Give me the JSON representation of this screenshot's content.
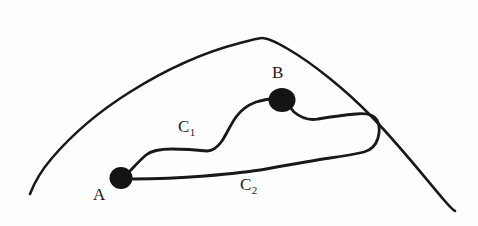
{
  "figure": {
    "background_color": "#fefefe",
    "stroke_color": "#191919",
    "node_color": "#141414",
    "width": 478,
    "height": 226,
    "labels": {
      "point_a": "A",
      "point_b": "B",
      "curve_c1_base": "C",
      "curve_c1_sub": "1",
      "curve_c2_base": "C",
      "curve_c2_sub": "2"
    },
    "nodes": [
      {
        "name": "A",
        "x": 121,
        "y": 178,
        "rx": 11.5,
        "ry": 11.0
      },
      {
        "name": "B",
        "x": 282,
        "y": 100,
        "rx": 13.5,
        "ry": 12.0
      }
    ],
    "paths": {
      "region_boundary": "M 30 194 C 33 186 40 172 52 158 C 70 137 98 112 130 92 C 165 70 205 52 240 43 C 252 40 258 38 262 38 C 268 38 276 42 288 49 C 312 63 345 89 372 117 C 400 146 426 179 444 200 C 450 207 453 210 455 211",
      "curve_c1": "M 128 173 C 134 167 140 160 146 155 C 152 150 160 149 172 149 C 184 149 198 150 207 151 C 213 151 217 148 222 141 C 227 133 231 124 236 117 C 241 110 248 105 256 102 C 263 100 268 99 272 99",
      "curve_c2_and_loop": "M 133 179 C 150 179 180 178 205 176 C 228 174 248 172 266 169 C 288 165 310 161 330 158 C 345 156 356 154 364 152 C 371 150 376 145 378 138 C 380 131 379 124 377 120 C 374 115 366 113 356 114 C 344 115 330 117 318 119 C 308 121 300 117 294 112 C 290 108 288 104 287 102"
    },
    "stroke_widths": {
      "region_boundary": 2.6,
      "curves": 2.8
    }
  }
}
